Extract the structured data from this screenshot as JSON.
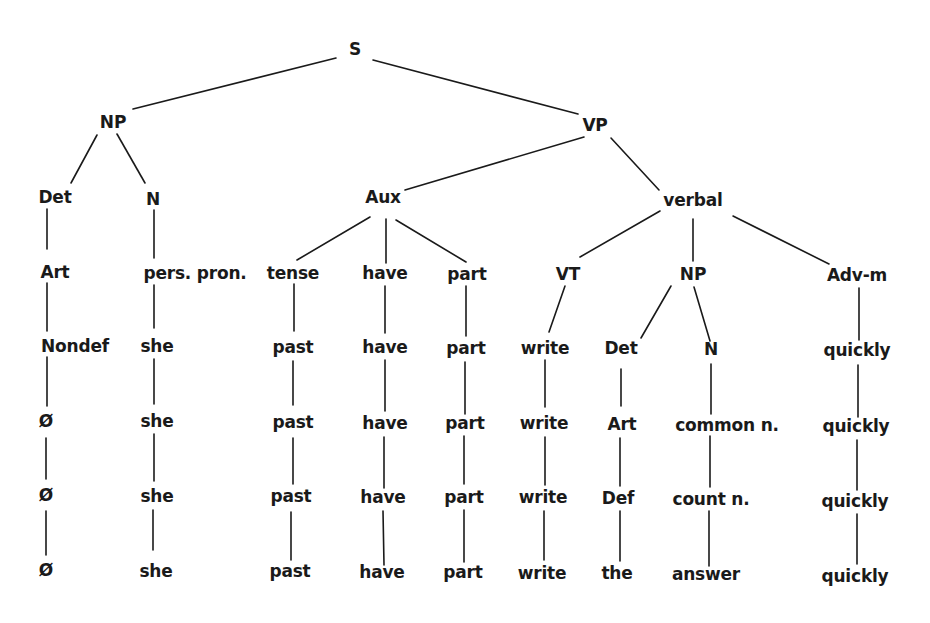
{
  "diagram": {
    "type": "syntax-tree",
    "nodes": [
      {
        "id": "s",
        "label": "S",
        "x": 355,
        "y": 49
      },
      {
        "id": "np1",
        "label": "NP",
        "x": 113,
        "y": 122
      },
      {
        "id": "vp",
        "label": "VP",
        "x": 595,
        "y": 125
      },
      {
        "id": "det1",
        "label": "Det",
        "x": 55,
        "y": 197
      },
      {
        "id": "n1",
        "label": "N",
        "x": 153,
        "y": 199
      },
      {
        "id": "aux",
        "label": "Aux",
        "x": 383,
        "y": 197
      },
      {
        "id": "verbal",
        "label": "verbal",
        "x": 693,
        "y": 200
      },
      {
        "id": "art1",
        "label": "Art",
        "x": 55,
        "y": 272
      },
      {
        "id": "perspron",
        "label": "pers. pron.",
        "x": 195,
        "y": 273
      },
      {
        "id": "tense",
        "label": "tense",
        "x": 293,
        "y": 273
      },
      {
        "id": "have1",
        "label": "have",
        "x": 385,
        "y": 273
      },
      {
        "id": "part1",
        "label": "part",
        "x": 467,
        "y": 274
      },
      {
        "id": "vt",
        "label": "VT",
        "x": 568,
        "y": 274
      },
      {
        "id": "np2",
        "label": "NP",
        "x": 693,
        "y": 274
      },
      {
        "id": "advm",
        "label": "Adv-m",
        "x": 857,
        "y": 275
      },
      {
        "id": "nondef",
        "label": "Nondef",
        "x": 75,
        "y": 346
      },
      {
        "id": "she1",
        "label": "she",
        "x": 157,
        "y": 346
      },
      {
        "id": "past1",
        "label": "past",
        "x": 293,
        "y": 347
      },
      {
        "id": "have2",
        "label": "have",
        "x": 385,
        "y": 347
      },
      {
        "id": "part2",
        "label": "part",
        "x": 466,
        "y": 348
      },
      {
        "id": "write1",
        "label": "write",
        "x": 545,
        "y": 348
      },
      {
        "id": "det2",
        "label": "Det",
        "x": 621,
        "y": 348
      },
      {
        "id": "n2",
        "label": "N",
        "x": 711,
        "y": 349
      },
      {
        "id": "quickly1",
        "label": "quickly",
        "x": 857,
        "y": 350
      },
      {
        "id": "null1",
        "label": "Ø",
        "x": 46,
        "y": 421
      },
      {
        "id": "she2",
        "label": "she",
        "x": 157,
        "y": 421
      },
      {
        "id": "past2",
        "label": "past",
        "x": 293,
        "y": 422
      },
      {
        "id": "have3",
        "label": "have",
        "x": 385,
        "y": 423
      },
      {
        "id": "part3",
        "label": "part",
        "x": 465,
        "y": 423
      },
      {
        "id": "write2",
        "label": "write",
        "x": 544,
        "y": 423
      },
      {
        "id": "art2",
        "label": "Art",
        "x": 622,
        "y": 424
      },
      {
        "id": "commonn",
        "label": "common n.",
        "x": 727,
        "y": 425
      },
      {
        "id": "quickly2",
        "label": "quickly",
        "x": 856,
        "y": 426
      },
      {
        "id": "null2",
        "label": "Ø",
        "x": 46,
        "y": 495
      },
      {
        "id": "she3",
        "label": "she",
        "x": 157,
        "y": 496
      },
      {
        "id": "past3",
        "label": "past",
        "x": 291,
        "y": 496
      },
      {
        "id": "have4",
        "label": "have",
        "x": 383,
        "y": 497
      },
      {
        "id": "part4",
        "label": "part",
        "x": 464,
        "y": 497
      },
      {
        "id": "write3",
        "label": "write",
        "x": 543,
        "y": 497
      },
      {
        "id": "def",
        "label": "Def",
        "x": 618,
        "y": 498
      },
      {
        "id": "countn",
        "label": "count n.",
        "x": 711,
        "y": 499
      },
      {
        "id": "quickly3",
        "label": "quickly",
        "x": 855,
        "y": 501
      },
      {
        "id": "null3",
        "label": "Ø",
        "x": 46,
        "y": 570
      },
      {
        "id": "she4",
        "label": "she",
        "x": 156,
        "y": 571
      },
      {
        "id": "past4",
        "label": "past",
        "x": 290,
        "y": 571
      },
      {
        "id": "have5",
        "label": "have",
        "x": 382,
        "y": 572
      },
      {
        "id": "part5",
        "label": "part",
        "x": 463,
        "y": 572
      },
      {
        "id": "write4",
        "label": "write",
        "x": 542,
        "y": 573
      },
      {
        "id": "the",
        "label": "the",
        "x": 617,
        "y": 573
      },
      {
        "id": "answer",
        "label": "answer",
        "x": 706,
        "y": 574
      },
      {
        "id": "quickly4",
        "label": "quickly",
        "x": 855,
        "y": 576
      }
    ],
    "edges": [
      {
        "x1": 336,
        "y1": 58,
        "x2": 133,
        "y2": 109
      },
      {
        "x1": 373,
        "y1": 60,
        "x2": 578,
        "y2": 114
      },
      {
        "x1": 97,
        "y1": 135,
        "x2": 71,
        "y2": 183
      },
      {
        "x1": 117,
        "y1": 134,
        "x2": 145,
        "y2": 183
      },
      {
        "x1": 584,
        "y1": 137,
        "x2": 405,
        "y2": 190
      },
      {
        "x1": 611,
        "y1": 138,
        "x2": 659,
        "y2": 190
      },
      {
        "x1": 47,
        "y1": 209,
        "x2": 47,
        "y2": 249
      },
      {
        "x1": 154,
        "y1": 210,
        "x2": 154,
        "y2": 258
      },
      {
        "x1": 370,
        "y1": 217,
        "x2": 297,
        "y2": 260
      },
      {
        "x1": 386,
        "y1": 219,
        "x2": 386,
        "y2": 263
      },
      {
        "x1": 396,
        "y1": 220,
        "x2": 466,
        "y2": 262
      },
      {
        "x1": 660,
        "y1": 211,
        "x2": 580,
        "y2": 257
      },
      {
        "x1": 693,
        "y1": 219,
        "x2": 693,
        "y2": 261
      },
      {
        "x1": 733,
        "y1": 216,
        "x2": 829,
        "y2": 264
      },
      {
        "x1": 47,
        "y1": 283,
        "x2": 47,
        "y2": 331
      },
      {
        "x1": 154,
        "y1": 285,
        "x2": 154,
        "y2": 328
      },
      {
        "x1": 294,
        "y1": 284,
        "x2": 294,
        "y2": 331
      },
      {
        "x1": 385,
        "y1": 286,
        "x2": 385,
        "y2": 333
      },
      {
        "x1": 466,
        "y1": 286,
        "x2": 466,
        "y2": 336
      },
      {
        "x1": 565,
        "y1": 286,
        "x2": 549,
        "y2": 332
      },
      {
        "x1": 671,
        "y1": 286,
        "x2": 641,
        "y2": 338
      },
      {
        "x1": 694,
        "y1": 287,
        "x2": 710,
        "y2": 341
      },
      {
        "x1": 859,
        "y1": 288,
        "x2": 859,
        "y2": 340
      },
      {
        "x1": 47,
        "y1": 357,
        "x2": 47,
        "y2": 406
      },
      {
        "x1": 154,
        "y1": 359,
        "x2": 154,
        "y2": 404
      },
      {
        "x1": 293,
        "y1": 361,
        "x2": 293,
        "y2": 405
      },
      {
        "x1": 385,
        "y1": 360,
        "x2": 385,
        "y2": 411
      },
      {
        "x1": 465,
        "y1": 362,
        "x2": 465,
        "y2": 414
      },
      {
        "x1": 545,
        "y1": 360,
        "x2": 545,
        "y2": 407
      },
      {
        "x1": 621,
        "y1": 369,
        "x2": 621,
        "y2": 406
      },
      {
        "x1": 711,
        "y1": 364,
        "x2": 711,
        "y2": 414
      },
      {
        "x1": 858,
        "y1": 365,
        "x2": 858,
        "y2": 417
      },
      {
        "x1": 46,
        "y1": 438,
        "x2": 46,
        "y2": 479
      },
      {
        "x1": 154,
        "y1": 434,
        "x2": 154,
        "y2": 481
      },
      {
        "x1": 293,
        "y1": 438,
        "x2": 293,
        "y2": 484
      },
      {
        "x1": 384,
        "y1": 437,
        "x2": 384,
        "y2": 488
      },
      {
        "x1": 464,
        "y1": 436,
        "x2": 464,
        "y2": 484
      },
      {
        "x1": 545,
        "y1": 437,
        "x2": 545,
        "y2": 485
      },
      {
        "x1": 620,
        "y1": 438,
        "x2": 620,
        "y2": 486
      },
      {
        "x1": 710,
        "y1": 436,
        "x2": 710,
        "y2": 487
      },
      {
        "x1": 857,
        "y1": 440,
        "x2": 857,
        "y2": 490
      },
      {
        "x1": 46,
        "y1": 511,
        "x2": 46,
        "y2": 555
      },
      {
        "x1": 153,
        "y1": 510,
        "x2": 153,
        "y2": 550
      },
      {
        "x1": 291,
        "y1": 512,
        "x2": 291,
        "y2": 560
      },
      {
        "x1": 383,
        "y1": 511,
        "x2": 384,
        "y2": 565
      },
      {
        "x1": 464,
        "y1": 510,
        "x2": 464,
        "y2": 562
      },
      {
        "x1": 544,
        "y1": 511,
        "x2": 544,
        "y2": 560
      },
      {
        "x1": 620,
        "y1": 511,
        "x2": 620,
        "y2": 561
      },
      {
        "x1": 709,
        "y1": 511,
        "x2": 709,
        "y2": 566
      },
      {
        "x1": 857,
        "y1": 514,
        "x2": 857,
        "y2": 564
      }
    ]
  }
}
